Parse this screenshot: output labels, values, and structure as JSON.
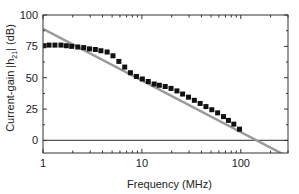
{
  "chart_data": {
    "type": "scatter",
    "title": "",
    "xlabel": "Frequency (MHz)",
    "ylabel_parts": {
      "pre": "Current-gain |h",
      "sub": "21",
      "post": "| (dB)"
    },
    "ylabel": "Current-gain |h21| (dB)",
    "xscale": "log",
    "xlim": [
      1,
      300
    ],
    "ylim": [
      -10,
      100
    ],
    "x_tick_labels": [
      {
        "value": 1,
        "label": "1"
      },
      {
        "value": 10,
        "label": "10"
      },
      {
        "value": 100,
        "label": "100"
      }
    ],
    "y_tick_labels": [
      {
        "value": 0,
        "label": "0"
      },
      {
        "value": 25,
        "label": "25"
      },
      {
        "value": 50,
        "label": "50"
      },
      {
        "value": 75,
        "label": "75"
      },
      {
        "value": 100,
        "label": "100"
      }
    ],
    "grid": false,
    "legend": "none",
    "reference_line": {
      "y": 0,
      "color": "#555555"
    },
    "series": [
      {
        "name": "measured",
        "marker": "square",
        "color": "#111111",
        "x": [
          1.02,
          1.15,
          1.32,
          1.52,
          1.72,
          1.95,
          2.25,
          2.58,
          2.95,
          3.38,
          3.85,
          4.45,
          5.1,
          5.85,
          6.7,
          7.65,
          8.8,
          10.1,
          11.6,
          13.3,
          15.0,
          17.2,
          19.7,
          22.6,
          25.8,
          29.6,
          33.9,
          38.8,
          44.4,
          50.9,
          58.3,
          66.8,
          75.0,
          85.0,
          97.0
        ],
        "y": [
          75.5,
          76,
          76,
          76,
          75.5,
          75,
          74.5,
          74,
          73,
          72.5,
          71.5,
          70.5,
          67.5,
          63,
          58.5,
          54,
          51,
          49,
          47,
          45,
          44,
          43,
          41.5,
          39.5,
          37,
          34.5,
          32,
          29.5,
          27,
          24.5,
          22,
          19,
          16,
          13,
          9
        ]
      },
      {
        "name": "fit",
        "type": "line",
        "color": "#9a9a9a",
        "x": [
          1,
          300
        ],
        "y": [
          89,
          -13
        ]
      }
    ]
  }
}
